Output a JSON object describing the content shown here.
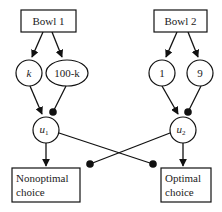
{
  "diagram": {
    "nodes": {
      "bowl1": {
        "label": "Bowl 1"
      },
      "bowl2": {
        "label": "Bowl 2"
      },
      "k": {
        "label": "k"
      },
      "hundred_minus_k": {
        "label": "100-k"
      },
      "one": {
        "label": "1"
      },
      "nine": {
        "label": "9"
      },
      "u1": {
        "label": "u",
        "subscript": "1"
      },
      "u2": {
        "label": "u",
        "subscript": "2"
      },
      "nonoptimal": {
        "line1": "Nonoptimal",
        "line2": "choice"
      },
      "optimal": {
        "line1": "Optimal",
        "line2": "choice"
      }
    },
    "edges": [
      {
        "from": "Bowl 1",
        "to": "k",
        "type": "excitatory-arrow"
      },
      {
        "from": "Bowl 1",
        "to": "100-k",
        "type": "excitatory-arrow"
      },
      {
        "from": "Bowl 2",
        "to": "1",
        "type": "excitatory-arrow"
      },
      {
        "from": "Bowl 2",
        "to": "9",
        "type": "excitatory-arrow"
      },
      {
        "from": "k",
        "to": "u1",
        "type": "excitatory-arrow"
      },
      {
        "from": "100-k",
        "to": "u1",
        "type": "inhibitory-dot"
      },
      {
        "from": "1",
        "to": "u2",
        "type": "excitatory-arrow"
      },
      {
        "from": "9",
        "to": "u2",
        "type": "inhibitory-dot"
      },
      {
        "from": "u1",
        "to": "Nonoptimal choice",
        "type": "excitatory-arrow"
      },
      {
        "from": "u1",
        "to": "Optimal choice",
        "type": "inhibitory-dot"
      },
      {
        "from": "u2",
        "to": "Optimal choice",
        "type": "excitatory-arrow"
      },
      {
        "from": "u2",
        "to": "Nonoptimal choice",
        "type": "inhibitory-dot"
      }
    ]
  }
}
